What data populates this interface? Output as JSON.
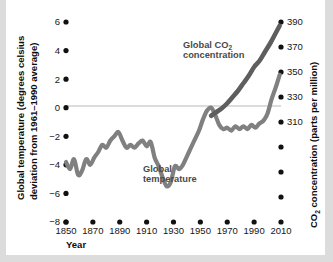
{
  "chart_data": {
    "type": "line",
    "title": "",
    "xlabel": "Year",
    "ylabel": "Global temperature (degrees celsius deviation from 1961–1990 average)",
    "y2label": "CO₂ concentration (parts per million)",
    "xlim": [
      1850,
      2010
    ],
    "ylim": [
      -8,
      6
    ],
    "y2lim": [
      230,
      390
    ],
    "grid": false,
    "legend_position": "inline-annotations",
    "x_ticks": [
      1850,
      1870,
      1890,
      1910,
      1930,
      1950,
      1970,
      1990,
      2010
    ],
    "x_tick_labels": [
      "1850",
      "1870",
      "1890",
      "1910",
      "1930",
      "1950",
      "1970",
      "1990",
      "2010"
    ],
    "y_ticks": [
      6,
      4,
      2,
      0,
      -2,
      -4,
      -6,
      -8
    ],
    "y_tick_labels": [
      "6",
      "4",
      "2",
      "0",
      "−2",
      "−4",
      "−6",
      "−8"
    ],
    "y2_ticks": [
      390,
      370,
      350,
      330,
      310,
      290,
      270,
      250
    ],
    "y2_tick_labels": [
      "390",
      "370",
      "350",
      "330",
      "310",
      "",
      "",
      ""
    ],
    "zero_line_value": 0,
    "annotations": [
      {
        "name": "co2-label",
        "text_line1": "Global CO",
        "subscript": "2",
        "text_line2": "concentration",
        "x": 1955,
        "y": 4.6
      },
      {
        "name": "temperature-label",
        "text_line1": "Global",
        "text_line2": "temperature",
        "x": 1920,
        "y": -5.2
      }
    ],
    "series": [
      {
        "name": "Global temperature",
        "color": "#808080",
        "axis": "left",
        "units": "degrees celsius deviation from 1961–1990 average",
        "x": [
          1850,
          1853,
          1856,
          1859,
          1862,
          1865,
          1868,
          1871,
          1874,
          1877,
          1880,
          1883,
          1886,
          1889,
          1892,
          1895,
          1898,
          1901,
          1904,
          1907,
          1910,
          1913,
          1916,
          1919,
          1922,
          1925,
          1928,
          1931,
          1934,
          1937,
          1940,
          1943,
          1946,
          1949,
          1952,
          1955,
          1958,
          1961,
          1964,
          1967,
          1970,
          1973,
          1976,
          1979,
          1982,
          1985,
          1988,
          1991,
          1994,
          1997,
          2000,
          2003,
          2006,
          2009
        ],
        "values": [
          -3.8,
          -4.3,
          -3.6,
          -4.7,
          -4.4,
          -3.6,
          -4.0,
          -3.5,
          -3.1,
          -2.6,
          -2.8,
          -2.3,
          -2.0,
          -1.7,
          -2.3,
          -2.8,
          -2.6,
          -2.8,
          -2.5,
          -2.3,
          -2.7,
          -2.4,
          -3.5,
          -4.1,
          -4.9,
          -5.5,
          -5.2,
          -4.1,
          -4.3,
          -4.0,
          -3.4,
          -2.8,
          -2.2,
          -1.6,
          -0.8,
          -0.2,
          0.0,
          -0.5,
          -1.2,
          -1.5,
          -1.4,
          -1.6,
          -1.3,
          -1.5,
          -1.3,
          -1.5,
          -1.2,
          -1.4,
          -1.1,
          -0.9,
          -0.4,
          0.6,
          1.4,
          2.3
        ]
      },
      {
        "name": "Global CO2 concentration",
        "color": "#5e5e5e",
        "axis": "right",
        "units": "parts per million",
        "x": [
          1958,
          1962,
          1966,
          1970,
          1974,
          1978,
          1982,
          1986,
          1990,
          1994,
          1998,
          2002,
          2006,
          2009
        ],
        "values": [
          315,
          318,
          321,
          325,
          330,
          335,
          341,
          347,
          354,
          359,
          366,
          373,
          381,
          387
        ]
      }
    ]
  },
  "axes": {
    "left_title": {
      "line1": "Global temperature (degrees celsius",
      "line2": "deviation from 1961–1990 average)"
    },
    "right_title": {
      "prefix": "CO",
      "subscript": "2",
      "suffix": " concentration (parts per million)"
    },
    "x_title": "Year"
  }
}
